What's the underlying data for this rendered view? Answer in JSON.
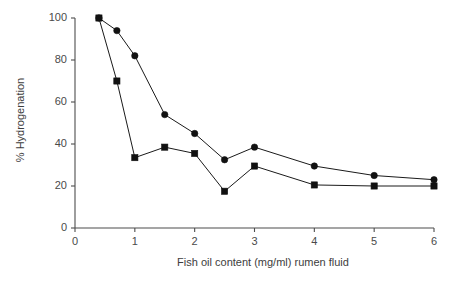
{
  "chart_data": {
    "type": "line",
    "title": "",
    "xlabel": "Fish oil content (mg/ml) rumen fluid",
    "ylabel": "% Hydrogenation",
    "xlim": [
      0,
      6
    ],
    "ylim": [
      0,
      100
    ],
    "xticks": [
      0,
      1,
      2,
      3,
      4,
      5,
      6
    ],
    "xtick_labels": [
      "0",
      "1",
      "2",
      "3",
      "4",
      "5",
      "6"
    ],
    "yticks": [
      0,
      20,
      40,
      60,
      80,
      100
    ],
    "ytick_labels": [
      "0",
      "20",
      "40",
      "60",
      "80",
      "100"
    ],
    "grid": false,
    "legend": "none",
    "series": [
      {
        "name": "circle-series",
        "marker": "circle",
        "color": "#111111",
        "x": [
          0.4,
          0.7,
          1.0,
          1.5,
          2.0,
          2.5,
          3.0,
          4.0,
          5.0,
          6.0
        ],
        "values": [
          100,
          94,
          82,
          54,
          45,
          32.5,
          38.5,
          29.5,
          25,
          23
        ]
      },
      {
        "name": "square-series",
        "marker": "square",
        "color": "#111111",
        "x": [
          0.4,
          0.7,
          1.0,
          1.5,
          2.0,
          2.5,
          3.0,
          4.0,
          5.0,
          6.0
        ],
        "values": [
          100,
          70,
          33.5,
          38.5,
          35.5,
          17.5,
          29.5,
          20.5,
          20,
          20
        ]
      }
    ]
  }
}
